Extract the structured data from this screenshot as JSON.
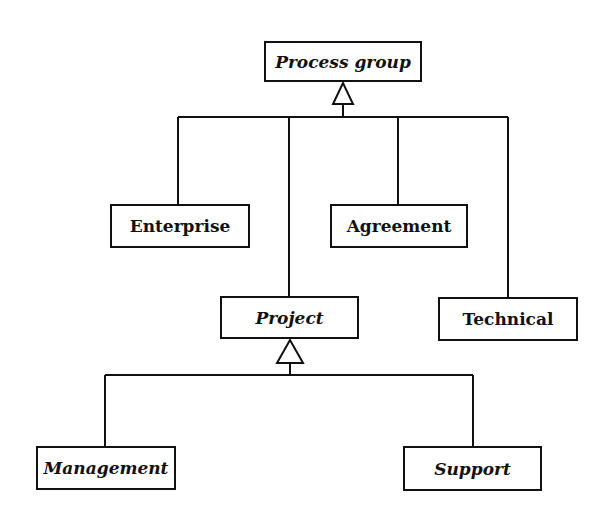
{
  "diagram": {
    "type": "uml-class-hierarchy",
    "nodes": {
      "process_group": {
        "label": "Process group",
        "abstract": true
      },
      "enterprise": {
        "label": "Enterprise",
        "abstract": false
      },
      "agreement": {
        "label": "Agreement",
        "abstract": false
      },
      "project": {
        "label": "Project",
        "abstract": true
      },
      "technical": {
        "label": "Technical",
        "abstract": false
      },
      "management": {
        "label": "Management",
        "abstract": true
      },
      "support": {
        "label": "Support",
        "abstract": true
      }
    },
    "edges": [
      {
        "from": "enterprise",
        "to": "process_group",
        "type": "generalization"
      },
      {
        "from": "project",
        "to": "process_group",
        "type": "generalization"
      },
      {
        "from": "agreement",
        "to": "process_group",
        "type": "generalization"
      },
      {
        "from": "technical",
        "to": "process_group",
        "type": "generalization"
      },
      {
        "from": "management",
        "to": "project",
        "type": "generalization"
      },
      {
        "from": "support",
        "to": "project",
        "type": "generalization"
      }
    ],
    "colors": {
      "stroke": "#111111",
      "background": "#ffffff"
    }
  }
}
